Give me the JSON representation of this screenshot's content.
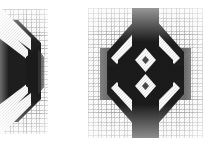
{
  "page": {
    "background_color": "#ffffff",
    "width": 211,
    "height": 144
  },
  "palette": {
    "paper": "#ffffff",
    "grid_line": "#9a9a9a",
    "grid_major": "#7d7d7d",
    "ink_black": "#1b1b1b",
    "ink_dark": "#262626",
    "ink_gray": "#5e5e5e",
    "ink_mid_gray": "#6f6f6f",
    "highlight_white": "#fbfbfb"
  },
  "figures": [
    {
      "id": "figure-left",
      "name": "left-figure-panel",
      "clipped": true,
      "clip_side": "left",
      "x": 0,
      "y": 9,
      "width": 48,
      "height": 125,
      "shape": "octagonal-lobe",
      "description": "Partially cropped octagonal dark mass with two white diagonal band separations in upper-right and lower-right quadrants",
      "regions": [
        {
          "name": "upper-diagonal-white-band-outer",
          "tone": "#fbfbfb"
        },
        {
          "name": "upper-diagonal-white-band-inner",
          "tone": "#fbfbfb"
        },
        {
          "name": "core-dark-mass",
          "tone": "#1b1b1b"
        },
        {
          "name": "lower-diagonal-white-band-outer",
          "tone": "#fbfbfb"
        },
        {
          "name": "lower-diagonal-white-band-inner",
          "tone": "#fbfbfb"
        }
      ]
    },
    {
      "id": "figure-right",
      "name": "right-figure-panel",
      "clipped": false,
      "x": 88,
      "y": 8,
      "width": 115,
      "height": 130,
      "shape": "symmetric-diamond-lens",
      "description": "Mirror-symmetric diamond/lens figure: black core with two stacked white diamond voids at center, white chevron bands top and bottom, and medium-gray rectangular side blocks at left and right",
      "regions": [
        {
          "name": "top-dark-apex",
          "tone": "#1b1b1b"
        },
        {
          "name": "top-white-chevron-outer",
          "tone": "#fbfbfb"
        },
        {
          "name": "top-white-chevron-inner",
          "tone": "#fbfbfb"
        },
        {
          "name": "left-gray-side-block",
          "tone": "#6f6f6f"
        },
        {
          "name": "right-gray-side-block",
          "tone": "#6f6f6f"
        },
        {
          "name": "core-dark-mass",
          "tone": "#1b1b1b"
        },
        {
          "name": "upper-white-diamond-void",
          "tone": "#fbfbfb"
        },
        {
          "name": "lower-white-diamond-void",
          "tone": "#fbfbfb"
        },
        {
          "name": "bottom-white-chevron-inner",
          "tone": "#fbfbfb"
        },
        {
          "name": "bottom-white-chevron-outer",
          "tone": "#fbfbfb"
        },
        {
          "name": "bottom-dark-apex",
          "tone": "#1b1b1b"
        }
      ]
    }
  ]
}
